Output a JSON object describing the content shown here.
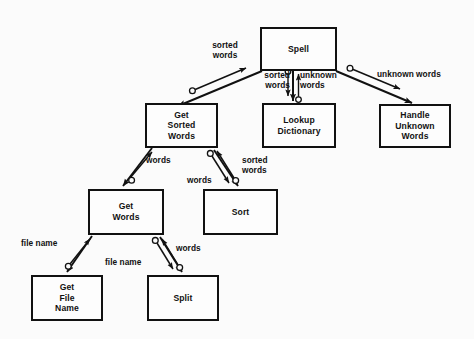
{
  "diagram": {
    "type": "structure-chart",
    "background_color": "#fbfbfb",
    "line_color": "#111111",
    "box_fill": "#fdfdfd"
  },
  "modules": [
    {
      "id": "spell",
      "label": "Spell",
      "x": 260,
      "y": 27,
      "w": 77,
      "h": 44
    },
    {
      "id": "get_sorted",
      "label": "Get\nSorted\nWords",
      "x": 145,
      "y": 103,
      "w": 73,
      "h": 45
    },
    {
      "id": "lookup_dict",
      "label": "Lookup\nDictionary",
      "x": 262,
      "y": 103,
      "w": 74,
      "h": 45
    },
    {
      "id": "handle_unknown",
      "label": "Handle\nUnknown\nWords",
      "x": 379,
      "y": 104,
      "w": 72,
      "h": 44
    },
    {
      "id": "get_words",
      "label": "Get\nWords",
      "x": 88,
      "y": 189,
      "w": 76,
      "h": 46
    },
    {
      "id": "sort",
      "label": "Sort",
      "x": 203,
      "y": 189,
      "w": 75,
      "h": 46
    },
    {
      "id": "get_file_name",
      "label": "Get\nFile\nName",
      "x": 31,
      "y": 275,
      "w": 72,
      "h": 46
    },
    {
      "id": "split",
      "label": "Split",
      "x": 147,
      "y": 275,
      "w": 72,
      "h": 46
    }
  ],
  "flow_labels": [
    {
      "id": "spell-getsorted-sortedwords",
      "text": "sorted\nwords",
      "x": 199,
      "y": 40,
      "w": 52,
      "align": "center"
    },
    {
      "id": "spell-lookup-sortedwords",
      "text": "sorted\nwords",
      "x": 256,
      "y": 70,
      "w": 34,
      "align": "right"
    },
    {
      "id": "spell-lookup-unknownwords",
      "text": "unknown\nwords",
      "x": 300,
      "y": 70,
      "w": 46,
      "align": "left"
    },
    {
      "id": "spell-handle-unknownwords",
      "text": "unknown words",
      "x": 377,
      "y": 69,
      "w": 76,
      "align": "left"
    },
    {
      "id": "getsorted-getwords-words",
      "text": "words",
      "x": 146,
      "y": 155,
      "w": 32,
      "align": "left"
    },
    {
      "id": "getsorted-sort-words",
      "text": "words",
      "x": 187,
      "y": 175,
      "w": 32,
      "align": "left"
    },
    {
      "id": "getsorted-sort-sortedwords",
      "text": "sorted\nwords",
      "x": 242,
      "y": 155,
      "w": 36,
      "align": "left"
    },
    {
      "id": "getwords-getfile-filename",
      "text": "file name",
      "x": 21,
      "y": 238,
      "w": 48,
      "align": "left"
    },
    {
      "id": "getwords-split-filename",
      "text": "file name",
      "x": 105,
      "y": 257,
      "w": 48,
      "align": "left"
    },
    {
      "id": "getwords-split-words",
      "text": "words",
      "x": 176,
      "y": 243,
      "w": 34,
      "align": "left"
    }
  ],
  "connections": [
    {
      "id": "call-spell-getsorted",
      "kind": "invocation",
      "from": "spell",
      "to": "get_sorted"
    },
    {
      "id": "data-spell-getsorted",
      "kind": "data-couple",
      "label": "sorted words",
      "direction": "up"
    },
    {
      "id": "call-spell-lookup",
      "kind": "invocation",
      "from": "spell",
      "to": "lookup_dict"
    },
    {
      "id": "data-spell-lookup-down",
      "kind": "data-couple",
      "label": "sorted words",
      "direction": "down"
    },
    {
      "id": "data-spell-lookup-up",
      "kind": "data-couple",
      "label": "unknown words",
      "direction": "up"
    },
    {
      "id": "call-spell-handle",
      "kind": "invocation",
      "from": "spell",
      "to": "handle_unknown"
    },
    {
      "id": "data-spell-handle",
      "kind": "data-couple",
      "label": "unknown words",
      "direction": "down"
    },
    {
      "id": "call-getsorted-getwords",
      "kind": "invocation",
      "from": "get_sorted",
      "to": "get_words"
    },
    {
      "id": "data-getsorted-getwords",
      "kind": "data-couple",
      "label": "words",
      "direction": "up"
    },
    {
      "id": "call-getsorted-sort",
      "kind": "invocation",
      "from": "get_sorted",
      "to": "sort"
    },
    {
      "id": "data-getsorted-sort-dn",
      "kind": "data-couple",
      "label": "words",
      "direction": "down"
    },
    {
      "id": "data-getsorted-sort-up",
      "kind": "data-couple",
      "label": "sorted words",
      "direction": "up"
    },
    {
      "id": "call-getwords-getfile",
      "kind": "invocation",
      "from": "get_words",
      "to": "get_file_name"
    },
    {
      "id": "data-getwords-getfile",
      "kind": "data-couple",
      "label": "file name",
      "direction": "up"
    },
    {
      "id": "call-getwords-split",
      "kind": "invocation",
      "from": "get_words",
      "to": "split"
    },
    {
      "id": "data-getwords-split-dn",
      "kind": "data-couple",
      "label": "file name",
      "direction": "down"
    },
    {
      "id": "data-getwords-split-up",
      "kind": "data-couple",
      "label": "words",
      "direction": "up"
    }
  ]
}
